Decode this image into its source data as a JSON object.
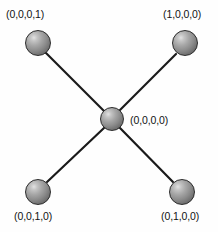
{
  "figure": {
    "type": "node-link-diagram",
    "background_color": "#fefefe",
    "edge_color": "#1a1a1a",
    "node_color": "#8c8c8c",
    "text_color": "#121212"
  },
  "nodes": [
    {
      "id": "top-left",
      "label": "(0,0,0,1)",
      "cx": 38,
      "cy": 43,
      "r": 13,
      "label_x": 6,
      "label_y": 8
    },
    {
      "id": "top-right",
      "label": "(1,0,0,0)",
      "cx": 185,
      "cy": 43,
      "r": 13,
      "label_x": 163,
      "label_y": 8
    },
    {
      "id": "center",
      "label": "(0,0,0,0)",
      "cx": 112,
      "cy": 119,
      "r": 12,
      "label_x": 130,
      "label_y": 114
    },
    {
      "id": "bottom-left",
      "label": "(0,0,1,0)",
      "cx": 38,
      "cy": 192,
      "r": 13,
      "label_x": 14,
      "label_y": 210
    },
    {
      "id": "bottom-right",
      "label": "(0,1,0,0)",
      "cx": 182,
      "cy": 192,
      "r": 13,
      "label_x": 161,
      "label_y": 210
    }
  ],
  "edges": [
    {
      "from": "top-left",
      "to": "center",
      "x1": 46,
      "y1": 53,
      "x2": 104,
      "y2": 111
    },
    {
      "from": "top-right",
      "to": "center",
      "x1": 176,
      "y1": 54,
      "x2": 120,
      "y2": 110
    },
    {
      "from": "bottom-left",
      "to": "center",
      "x1": 47,
      "y1": 182,
      "x2": 104,
      "y2": 128
    },
    {
      "from": "bottom-right",
      "to": "center",
      "x1": 173,
      "y1": 182,
      "x2": 120,
      "y2": 128
    }
  ]
}
